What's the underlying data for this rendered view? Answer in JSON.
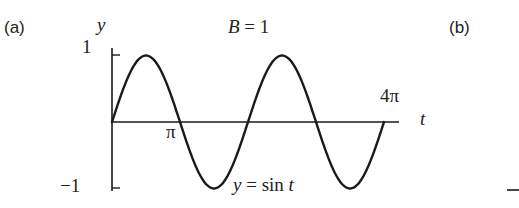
{
  "panels": {
    "a_label": "(a)",
    "b_label": "(b)"
  },
  "chart_data": {
    "type": "line",
    "title": "B = 1",
    "title_parts": {
      "var": "B",
      "eq": " = 1"
    },
    "xlabel": "t",
    "ylabel": "y",
    "curve_label": {
      "lhs": "y",
      "eq": " = sin ",
      "rhs": "t"
    },
    "function": "y = sin t",
    "x_range": [
      0,
      12.566
    ],
    "ylim": [
      -1,
      1
    ],
    "x_ticks": [
      {
        "value": 3.1416,
        "label": "π"
      },
      {
        "value": 12.566,
        "label": "4π"
      }
    ],
    "y_ticks": [
      {
        "value": 1,
        "label": "1"
      },
      {
        "value": -1,
        "label": "−1"
      }
    ],
    "x": [
      0,
      1.5708,
      3.1416,
      4.7124,
      6.2832,
      7.854,
      9.4248,
      10.9956,
      12.566
    ],
    "values": [
      0,
      1,
      0,
      -1,
      0,
      1,
      0,
      -1,
      0
    ],
    "grid": false,
    "legend": null
  },
  "style": {
    "ink": "#1a1a1a"
  }
}
